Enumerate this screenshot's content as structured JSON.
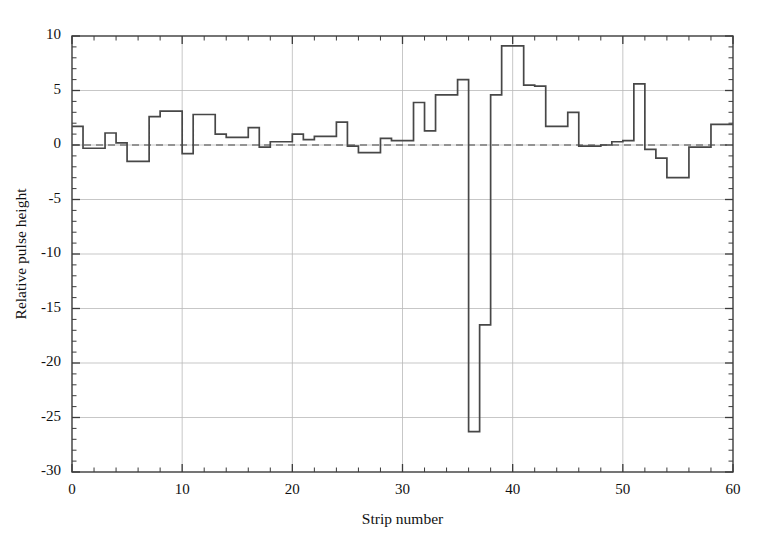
{
  "chart_data": {
    "type": "line",
    "subtype": "step-post",
    "title": "",
    "xlabel": "Strip number",
    "ylabel": "Relative pulse height",
    "xlim": [
      0,
      60
    ],
    "ylim": [
      -30,
      10
    ],
    "x_major_ticks": [
      0,
      10,
      20,
      30,
      40,
      50,
      60
    ],
    "x_tick_labels": [
      "0",
      "10",
      "20",
      "30",
      "40",
      "50",
      "60"
    ],
    "x_minor_interval": 2,
    "y_major_ticks": [
      10,
      5,
      0,
      -5,
      -10,
      -15,
      -20,
      -25,
      -30
    ],
    "y_tick_labels": [
      "10",
      "5",
      "0",
      "-5",
      "-10",
      "-15",
      "-20",
      "-25",
      "-30"
    ],
    "y_minor_interval": 1,
    "grid": true,
    "grid_color": "#b9b9b9",
    "zero_reference_line": 0,
    "zero_line_style": "dashed",
    "legend": null,
    "series_color": "#474747",
    "background_color": "#ffffff",
    "categories": [
      0,
      1,
      2,
      3,
      4,
      5,
      6,
      7,
      8,
      9,
      10,
      11,
      12,
      13,
      14,
      15,
      16,
      17,
      18,
      19,
      20,
      21,
      22,
      23,
      24,
      25,
      26,
      27,
      28,
      29,
      30,
      31,
      32,
      33,
      34,
      35,
      36,
      37,
      38,
      39,
      40,
      41,
      42,
      43,
      44,
      45,
      46,
      47,
      48,
      49,
      50,
      51,
      52,
      53,
      54,
      55,
      56,
      57,
      58,
      59
    ],
    "values": [
      1.7,
      -0.3,
      -0.3,
      1.1,
      0.2,
      -1.5,
      -1.5,
      2.6,
      3.1,
      3.1,
      -0.8,
      2.8,
      2.8,
      1.0,
      0.7,
      0.7,
      1.6,
      -0.2,
      0.3,
      0.3,
      1.0,
      0.5,
      0.8,
      0.8,
      2.1,
      -0.1,
      -0.7,
      -0.7,
      0.6,
      0.4,
      0.4,
      3.9,
      1.3,
      4.6,
      4.6,
      6.0,
      -26.3,
      -16.5,
      4.6,
      9.1,
      9.1,
      5.5,
      5.4,
      1.7,
      1.7,
      3.0,
      -0.1,
      -0.1,
      0.0,
      0.3,
      0.4,
      5.6,
      -0.4,
      -1.2,
      -3.0,
      -3.0,
      -0.2,
      -0.2,
      1.9,
      1.9
    ]
  },
  "axes": {
    "ylabel": "Relative pulse height",
    "xlabel": "Strip number"
  }
}
